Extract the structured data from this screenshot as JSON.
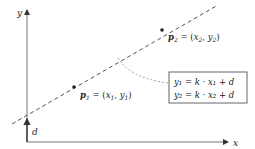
{
  "diagram": {
    "type": "linear-function-two-points",
    "axes": {
      "x_label": "x",
      "y_label": "y"
    },
    "line": {
      "style": "dashed"
    },
    "points": [
      {
        "name": "p1",
        "label_bold": "p",
        "label_sub": "1",
        "label_rest": " = (x",
        "coord_sub1": "1",
        "sep": ", y",
        "coord_sub2": "1",
        "close": ")"
      },
      {
        "name": "p2",
        "label_bold": "p",
        "label_sub": "2",
        "label_rest": " = (x",
        "coord_sub1": "2",
        "sep": ", y",
        "coord_sub2": "2",
        "close": ")"
      }
    ],
    "intercept_label": "d",
    "equations": [
      "y₁ = k · x₁ + d",
      "y₂ = k · x₂ + d"
    ],
    "colors": {
      "axis": "#555555",
      "line": "#555555",
      "text": "#222222",
      "box_border": "#666666",
      "connector": "#888888"
    }
  }
}
